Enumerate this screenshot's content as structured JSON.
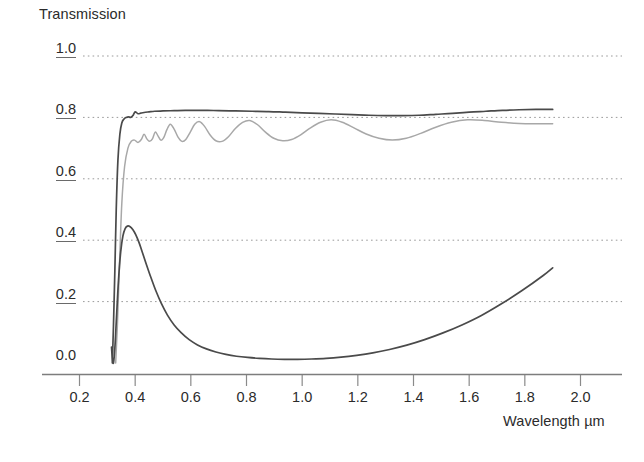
{
  "chart_data": {
    "type": "line",
    "title": "",
    "ylabel": "Transmission",
    "xlabel": "Wavelength µm",
    "xlim": [
      0.14,
      2.06
    ],
    "ylim": [
      0.0,
      1.05
    ],
    "grid": true,
    "legend": "none",
    "xticks": [
      "0.2",
      "0.4",
      "0.6",
      "0.8",
      "1.0",
      "1.2",
      "1.4",
      "1.6",
      "1.8",
      "2.0"
    ],
    "xtick_values": [
      0.2,
      0.4,
      0.6,
      0.8,
      1.0,
      1.2,
      1.4,
      1.6,
      1.8,
      2.0
    ],
    "yticks": [
      "0.0",
      "0.2",
      "0.4",
      "0.6",
      "0.8",
      "1.0"
    ],
    "ytick_values": [
      0.0,
      0.2,
      0.4,
      0.6,
      0.8,
      1.0
    ],
    "series": [
      {
        "name": "upper-transmission-curve",
        "color": "#4a4a4a",
        "width": 1.7,
        "x": [
          0.318,
          0.322,
          0.327,
          0.332,
          0.338,
          0.345,
          0.352,
          0.36,
          0.368,
          0.376,
          0.384,
          0.392,
          0.4,
          0.41,
          0.42,
          0.432,
          0.45,
          0.47,
          0.5,
          0.54,
          0.58,
          0.62,
          0.66,
          0.7,
          0.76,
          0.82,
          0.88,
          0.94,
          1.0,
          1.06,
          1.12,
          1.18,
          1.24,
          1.3,
          1.36,
          1.42,
          1.48,
          1.54,
          1.6,
          1.66,
          1.72,
          1.78,
          1.84,
          1.9
        ],
        "y": [
          0.0,
          0.12,
          0.3,
          0.5,
          0.66,
          0.745,
          0.782,
          0.795,
          0.8,
          0.802,
          0.8,
          0.806,
          0.818,
          0.812,
          0.814,
          0.816,
          0.818,
          0.82,
          0.821,
          0.822,
          0.823,
          0.823,
          0.823,
          0.822,
          0.821,
          0.82,
          0.819,
          0.817,
          0.815,
          0.813,
          0.811,
          0.809,
          0.807,
          0.806,
          0.806,
          0.807,
          0.81,
          0.813,
          0.817,
          0.82,
          0.823,
          0.825,
          0.826,
          0.826
        ]
      },
      {
        "name": "interference-fringe-curve",
        "color": "#a8a8a8",
        "width": 1.5,
        "x": [
          0.33,
          0.336,
          0.344,
          0.352,
          0.362,
          0.374,
          0.386,
          0.398,
          0.41,
          0.422,
          0.432,
          0.442,
          0.452,
          0.462,
          0.472,
          0.482,
          0.492,
          0.502,
          0.514,
          0.526,
          0.54,
          0.554,
          0.568,
          0.582,
          0.598,
          0.614,
          0.632,
          0.65,
          0.67,
          0.69,
          0.712,
          0.736,
          0.76,
          0.786,
          0.812,
          0.84,
          0.868,
          0.898,
          0.93,
          0.962,
          0.996,
          1.03,
          1.066,
          1.104,
          1.144,
          1.186,
          1.23,
          1.276,
          1.324,
          1.374,
          1.426,
          1.48,
          1.536,
          1.594,
          1.654,
          1.716,
          1.78,
          1.844,
          1.9
        ],
        "y": [
          0.0,
          0.12,
          0.33,
          0.52,
          0.64,
          0.7,
          0.722,
          0.726,
          0.718,
          0.728,
          0.745,
          0.73,
          0.722,
          0.73,
          0.752,
          0.74,
          0.726,
          0.733,
          0.76,
          0.778,
          0.762,
          0.736,
          0.722,
          0.728,
          0.752,
          0.778,
          0.786,
          0.77,
          0.742,
          0.724,
          0.722,
          0.738,
          0.764,
          0.784,
          0.79,
          0.776,
          0.752,
          0.732,
          0.724,
          0.728,
          0.744,
          0.766,
          0.784,
          0.792,
          0.784,
          0.766,
          0.746,
          0.732,
          0.726,
          0.732,
          0.748,
          0.768,
          0.784,
          0.792,
          0.79,
          0.784,
          0.78,
          0.779,
          0.779
        ]
      },
      {
        "name": "absorption-transmission-curve",
        "color": "#4a4a4a",
        "width": 1.7,
        "x": [
          0.315,
          0.318,
          0.322,
          0.327,
          0.333,
          0.34,
          0.348,
          0.356,
          0.364,
          0.372,
          0.382,
          0.392,
          0.402,
          0.414,
          0.426,
          0.44,
          0.456,
          0.474,
          0.494,
          0.516,
          0.54,
          0.566,
          0.594,
          0.624,
          0.656,
          0.69,
          0.726,
          0.764,
          0.804,
          0.846,
          0.89,
          0.936,
          0.984,
          1.034,
          1.086,
          1.14,
          1.196,
          1.254,
          1.314,
          1.376,
          1.44,
          1.506,
          1.574,
          1.644,
          1.716,
          1.79,
          1.866,
          1.9
        ],
        "y": [
          0.052,
          0.015,
          0.0,
          0.048,
          0.15,
          0.268,
          0.362,
          0.414,
          0.438,
          0.446,
          0.444,
          0.434,
          0.418,
          0.392,
          0.36,
          0.322,
          0.28,
          0.236,
          0.194,
          0.156,
          0.124,
          0.098,
          0.076,
          0.059,
          0.046,
          0.036,
          0.028,
          0.022,
          0.018,
          0.015,
          0.013,
          0.012,
          0.012,
          0.013,
          0.015,
          0.019,
          0.025,
          0.033,
          0.044,
          0.058,
          0.076,
          0.098,
          0.124,
          0.155,
          0.193,
          0.236,
          0.285,
          0.31
        ]
      }
    ]
  },
  "axes": {
    "y_title": "Transmission",
    "x_title": "Wavelength µm"
  }
}
